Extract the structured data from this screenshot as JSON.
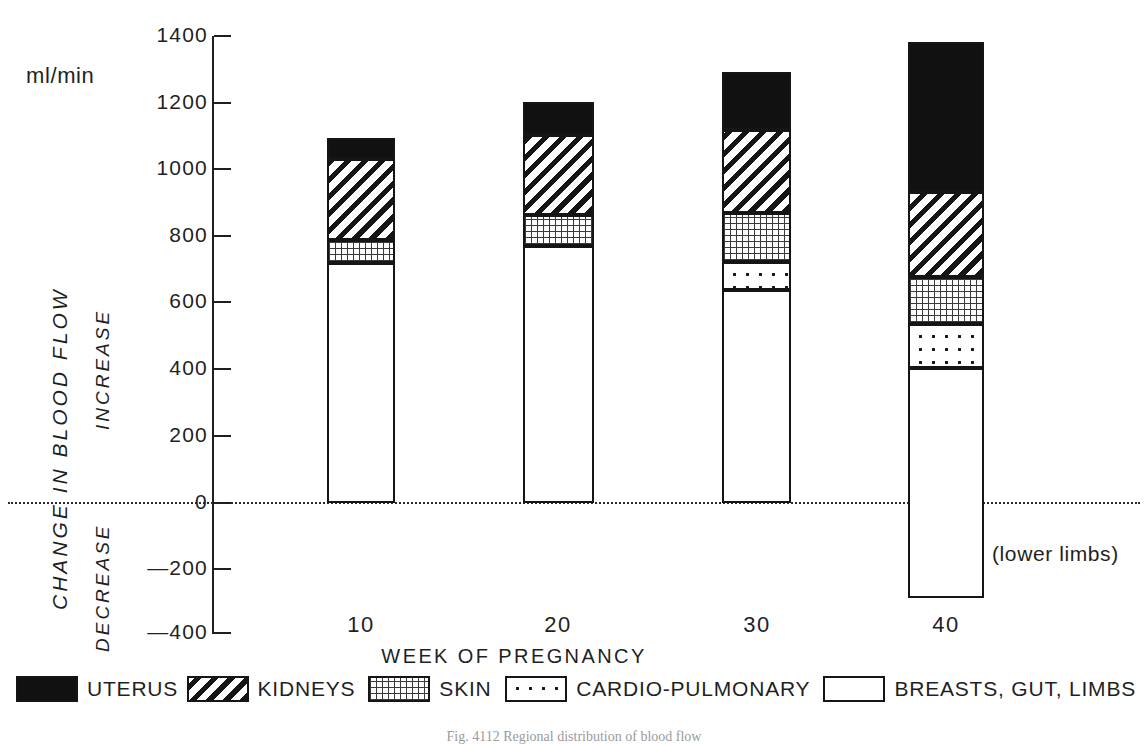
{
  "units_label": "ml/min",
  "axis": {
    "y_title": "CHANGE IN BLOOD FLOW",
    "y_positive_label": "INCREASE",
    "y_negative_label": "DECREASE",
    "x_title": "WEEK OF PREGNANCY",
    "y_ticks": [
      "1400",
      "1200",
      "1000",
      "800",
      "600",
      "400",
      "200",
      "0",
      "—200",
      "—400"
    ]
  },
  "annotation": "(lower limbs)",
  "caption": "Fig. 4112 Regional distribution of blood flow",
  "legend": [
    {
      "name": "uterus",
      "label": "UTERUS",
      "pattern": "solid-black"
    },
    {
      "name": "kidneys",
      "label": "KIDNEYS",
      "pattern": "diagonal-hatch"
    },
    {
      "name": "skin",
      "label": "SKIN",
      "pattern": "fine-dot-grid"
    },
    {
      "name": "cardio",
      "label": "CARDIO-PULMONARY",
      "pattern": "sparse-dots"
    },
    {
      "name": "other",
      "label": "BREASTS, GUT, LIMBS",
      "pattern": "white"
    }
  ],
  "chart_data": {
    "type": "bar",
    "subtype": "stacked-bar-with-negative",
    "title": "",
    "xlabel": "WEEK OF PREGNANCY",
    "ylabel": "CHANGE IN BLOOD FLOW",
    "yunits": "ml/min",
    "ylim": [
      -400,
      1400
    ],
    "ytick_step": 200,
    "grid": false,
    "legend_position": "bottom",
    "categories": [
      "10",
      "20",
      "30",
      "40"
    ],
    "series": [
      {
        "name": "BREASTS, GUT, LIMBS",
        "values": [
          720,
          770,
          640,
          -285
        ]
      },
      {
        "name": "CARDIO-PULMONARY",
        "values": [
          0,
          0,
          85,
          690
        ]
      },
      {
        "name": "SKIN",
        "values": [
          70,
          95,
          145,
          140
        ]
      },
      {
        "name": "KIDNEYS",
        "values": [
          240,
          240,
          250,
          255
        ]
      },
      {
        "name": "UTERUS",
        "values": [
          65,
          100,
          175,
          450
        ]
      }
    ],
    "stack_totals": [
      1095,
      1205,
      1295,
      1385
    ],
    "stack_boundaries": {
      "10": [
        0,
        720,
        720,
        790,
        1030,
        1095
      ],
      "20": [
        0,
        770,
        770,
        865,
        1105,
        1205
      ],
      "30": [
        0,
        640,
        725,
        870,
        1120,
        1295
      ],
      "40": [
        -285,
        405,
        540,
        680,
        935,
        1385
      ]
    }
  },
  "bars": [
    {
      "category": "10",
      "x": 327,
      "width": 68,
      "segments": [
        {
          "series": "UTERUS",
          "fill": "fill-uterus",
          "top": 138,
          "bottom": 159
        },
        {
          "series": "KIDNEYS",
          "fill": "fill-kidneys",
          "top": 159,
          "bottom": 240
        },
        {
          "series": "SKIN",
          "fill": "fill-skin",
          "top": 240,
          "bottom": 263
        },
        {
          "series": "BREASTS, GUT, LIMBS",
          "fill": "fill-other",
          "top": 263,
          "bottom": 503
        }
      ]
    },
    {
      "category": "20",
      "x": 523,
      "width": 71,
      "segments": [
        {
          "series": "UTERUS",
          "fill": "fill-uterus",
          "top": 102,
          "bottom": 135
        },
        {
          "series": "KIDNEYS",
          "fill": "fill-kidneys",
          "top": 135,
          "bottom": 215
        },
        {
          "series": "SKIN",
          "fill": "fill-skin",
          "top": 215,
          "bottom": 246
        },
        {
          "series": "BREASTS, GUT, LIMBS",
          "fill": "fill-other",
          "top": 246,
          "bottom": 503
        }
      ]
    },
    {
      "category": "30",
      "x": 722,
      "width": 69,
      "segments": [
        {
          "series": "UTERUS",
          "fill": "fill-uterus",
          "top": 72,
          "bottom": 130
        },
        {
          "series": "KIDNEYS",
          "fill": "fill-kidneys",
          "top": 130,
          "bottom": 213
        },
        {
          "series": "SKIN",
          "fill": "fill-skin",
          "top": 213,
          "bottom": 262
        },
        {
          "series": "CARDIO-PULMONARY",
          "fill": "fill-cardio",
          "top": 262,
          "bottom": 290
        },
        {
          "series": "BREASTS, GUT, LIMBS",
          "fill": "fill-other",
          "top": 290,
          "bottom": 503
        }
      ]
    },
    {
      "category": "40",
      "x": 908,
      "width": 76,
      "segments": [
        {
          "series": "UTERUS",
          "fill": "fill-uterus",
          "top": 42,
          "bottom": 192
        },
        {
          "series": "KIDNEYS",
          "fill": "fill-kidneys",
          "top": 192,
          "bottom": 277
        },
        {
          "series": "SKIN",
          "fill": "fill-skin",
          "top": 277,
          "bottom": 324
        },
        {
          "series": "CARDIO-PULMONARY",
          "fill": "fill-cardio",
          "top": 324,
          "bottom": 368
        },
        {
          "series": "BREASTS, GUT, LIMBS",
          "fill": "fill-other",
          "top": 368,
          "bottom": 598
        }
      ]
    }
  ],
  "tick_positions": [
    36,
    103,
    169,
    236,
    302,
    369,
    436,
    503,
    569,
    633
  ],
  "xtick_positions": [
    361,
    558,
    757,
    946
  ]
}
